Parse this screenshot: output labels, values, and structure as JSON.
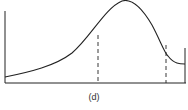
{
  "figure": {
    "caption": "(d)",
    "colors": {
      "stroke": "#222222",
      "background": "#ffffff"
    }
  }
}
